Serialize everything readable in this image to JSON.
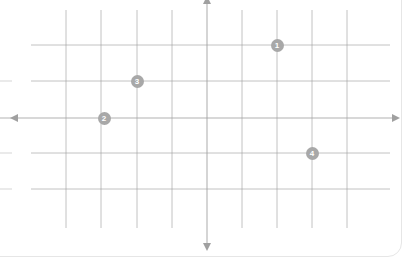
{
  "canvas": {
    "width": 415,
    "height": 263,
    "background": "#ffffff"
  },
  "card": {
    "label": "worksheet-card",
    "border_color": "#e6e6e6",
    "corner_radius": 14,
    "background": "#ffffff"
  },
  "chart_data": {
    "type": "scatter",
    "title": "",
    "subtitle": "",
    "xlabel": "",
    "ylabel": "",
    "grid": true,
    "legend": "none",
    "axis_style": "double-arrow",
    "axis_color": "#a0a0a0",
    "grid_color": "#9a9a9a",
    "xlim": [
      -6,
      4
    ],
    "ylim": [
      -3,
      3
    ],
    "x_ticks": [
      -4,
      -3,
      -2,
      -1,
      0,
      1,
      2,
      3,
      4
    ],
    "y_ticks": [
      -2,
      -1,
      0,
      1,
      2
    ],
    "tick_labels_shown": false,
    "origin_px": {
      "x": 207,
      "y": 118
    },
    "cell_px": {
      "x": 35.3,
      "y": 36
    },
    "grid_lines_px": {
      "vertical": [
        66,
        101,
        137,
        172,
        207,
        242,
        277,
        312,
        347
      ],
      "horizontal": [
        45,
        81,
        118,
        153,
        189
      ]
    },
    "grid_extent_px": {
      "vertical_top": 10,
      "vertical_bottom": 228,
      "horizontal_left": 31,
      "horizontal_right": 390
    },
    "axes_px": {
      "x_axis_y": 118,
      "x_axis_left": 17,
      "x_axis_right": 393,
      "y_axis_x": 207,
      "y_axis_top": 2,
      "y_axis_bottom": 245
    },
    "points": [
      {
        "label": "1",
        "x": 2,
        "y": 2,
        "px": 277,
        "py": 45,
        "color": "#a8a8a8"
      },
      {
        "label": "2",
        "x": -3,
        "y": 0,
        "px": 104,
        "py": 118,
        "color": "#a8a8a8"
      },
      {
        "label": "3",
        "x": -2,
        "y": 1,
        "px": 137,
        "py": 81,
        "color": "#a8a8a8"
      },
      {
        "label": "4",
        "x": 3,
        "y": -1,
        "px": 312,
        "py": 153,
        "color": "#a8a8a8"
      }
    ],
    "edge_stubs_px": {
      "note": "left-edge clipped grid line fragments",
      "x_start": 0,
      "x_end": 12,
      "ys": [
        81,
        118,
        153,
        189
      ]
    }
  }
}
